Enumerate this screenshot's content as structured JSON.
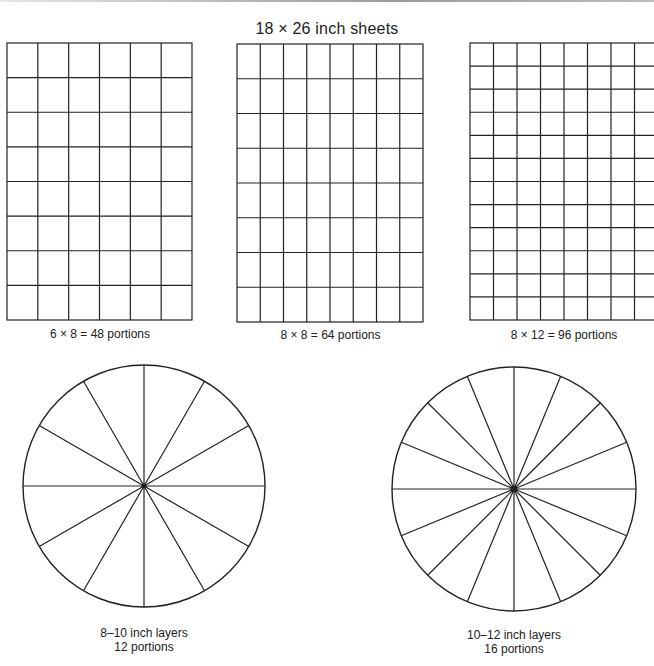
{
  "title": "18 × 26 inch sheets",
  "colors": {
    "line": "#222222",
    "background": "#ffffff"
  },
  "sheets": [
    {
      "label": "6 × 8 = 48 portions",
      "columns": 6,
      "rows": 8,
      "portions": 48
    },
    {
      "label": "8 × 8 = 64 portions",
      "columns": 8,
      "rows": 8,
      "portions": 64
    },
    {
      "label": "8 × 12 = 96 portions",
      "columns": 8,
      "rows": 12,
      "portions": 96
    }
  ],
  "rounds": [
    {
      "size_label": "8–10 inch layers",
      "portions_label": "12 portions",
      "slices": 12
    },
    {
      "size_label": "10–12 inch layers",
      "portions_label": "16 portions",
      "slices": 16
    }
  ]
}
